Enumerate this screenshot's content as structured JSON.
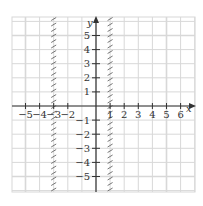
{
  "graph": {
    "x_axis_label": "x",
    "y_axis_label": "y",
    "x_ticks": [
      "−5",
      "−4",
      "−3",
      "−2",
      "1",
      "2",
      "3",
      "4",
      "5",
      "6"
    ],
    "x_tick_values": [
      -5,
      -4,
      -3,
      -2,
      1,
      2,
      3,
      4,
      5,
      6
    ],
    "y_ticks": [
      "5",
      "4",
      "3",
      "2",
      "1",
      "−1",
      "−2",
      "−3",
      "−4",
      "−5"
    ],
    "y_tick_values": [
      5,
      4,
      3,
      2,
      1,
      -1,
      -2,
      -3,
      -4,
      -5
    ],
    "x_range": [
      -6,
      7
    ],
    "y_range": [
      -6,
      6
    ],
    "boundaries": [
      {
        "x": -3,
        "style": "hatched",
        "description": "vertical line x = -3, hatched"
      },
      {
        "x": 1,
        "style": "hatched",
        "description": "vertical line x = 1, hatched"
      }
    ],
    "colors": {
      "grid": "#d8d8d8",
      "axis": "#333333",
      "hatch": "#666666"
    }
  }
}
